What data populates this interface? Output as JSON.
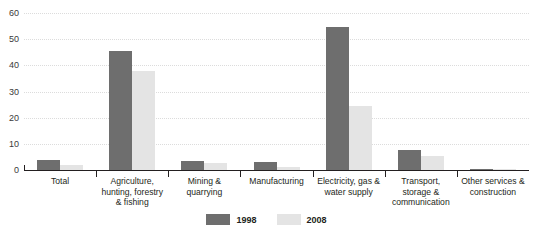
{
  "top_sliver_text": "",
  "chart_data": {
    "type": "bar",
    "title": "",
    "xlabel": "",
    "ylabel": "",
    "ylim": [
      0,
      60
    ],
    "yticks": [
      0,
      10,
      20,
      30,
      40,
      50,
      60
    ],
    "grid": true,
    "legend_position": "bottom-center",
    "categories": [
      "Total",
      "Agriculture, hunting, forestry & fishing",
      "Mining & quarrying",
      "Manufacturing",
      "Electricity, gas & water supply",
      "Transport, storage & communication",
      "Other services & construction"
    ],
    "category_lines": [
      [
        "Total"
      ],
      [
        "Agriculture,",
        "hunting, forestry",
        "& fishing"
      ],
      [
        "Mining &",
        "quarrying"
      ],
      [
        "Manufacturing"
      ],
      [
        "Electricity, gas &",
        "water supply"
      ],
      [
        "Transport,",
        "storage &",
        "communication"
      ],
      [
        "Other services &",
        "construction"
      ]
    ],
    "series": [
      {
        "name": "1998",
        "color": "#6e6e6e",
        "values": [
          4.0,
          45.5,
          3.5,
          3.0,
          54.5,
          7.5,
          0.4
        ]
      },
      {
        "name": "2008",
        "color": "#e4e4e4",
        "values": [
          2.0,
          38.0,
          2.5,
          1.2,
          24.5,
          5.5,
          0.3
        ]
      }
    ]
  },
  "legend": {
    "items": [
      {
        "label": "1998",
        "color": "#6e6e6e"
      },
      {
        "label": "2008",
        "color": "#e4e4e4"
      }
    ]
  },
  "axis": {
    "ytick_labels": [
      "60",
      "50",
      "40",
      "30",
      "20",
      "10",
      "0"
    ]
  }
}
